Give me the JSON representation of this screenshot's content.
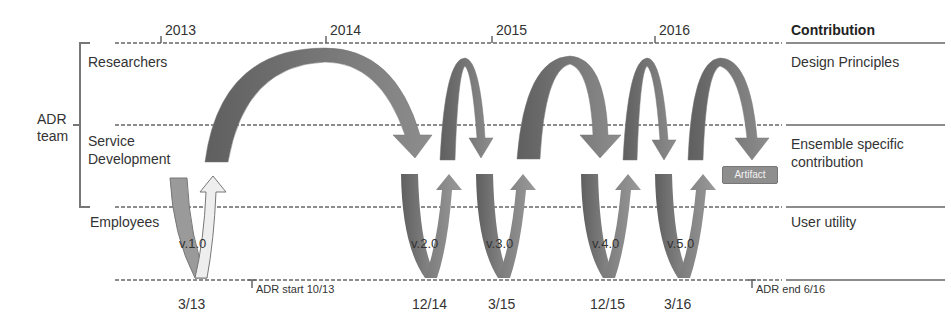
{
  "diagram": {
    "team_label_line1": "ADR",
    "team_label_line2": "team",
    "rows": [
      {
        "label": "Researchers"
      },
      {
        "label_line1": "Service",
        "label_line2": "Development"
      },
      {
        "label": "Employees"
      }
    ],
    "years": [
      "2013",
      "2014",
      "2015",
      "2016"
    ],
    "contribution_header": "Contribution",
    "contributions": {
      "design": "Design Principles",
      "ensemble_line1": "Ensemble specific",
      "ensemble_line2": "contribution",
      "user": "User utility"
    },
    "versions": [
      "v.1.0",
      "v.2.0",
      "v.3.0",
      "v.4.0",
      "v.5.0"
    ],
    "dates": [
      "3/13",
      "12/14",
      "3/15",
      "12/15",
      "3/16"
    ],
    "adr_start": "ADR start 10/13",
    "adr_end": "ADR end 6/16",
    "artifact_label": "Artifact",
    "colors": {
      "arrow_dark": "#6e6e6e",
      "arrow_mid": "#8a8a8a",
      "arrow_light": "#e8e8e8",
      "line": "#8c8c8c",
      "artifact_bg": "#8e8e8e"
    }
  }
}
